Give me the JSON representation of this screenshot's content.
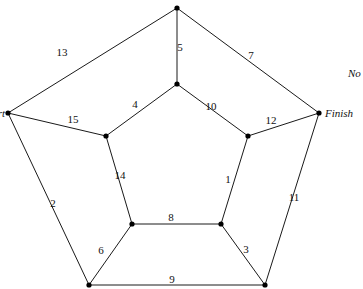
{
  "graph": {
    "nodes": [
      {
        "id": "outer_top",
        "x": 177,
        "y": 8
      },
      {
        "id": "inner_top",
        "x": 177,
        "y": 84
      },
      {
        "id": "start",
        "x": 8,
        "y": 113,
        "label": "Start"
      },
      {
        "id": "finish",
        "x": 319,
        "y": 113,
        "label": "Finish"
      },
      {
        "id": "inner_left",
        "x": 106,
        "y": 136
      },
      {
        "id": "inner_right",
        "x": 248,
        "y": 136
      },
      {
        "id": "inner_bottom_left",
        "x": 132,
        "y": 224
      },
      {
        "id": "inner_bottom_right",
        "x": 221,
        "y": 224
      },
      {
        "id": "outer_bottom_left",
        "x": 89,
        "y": 285
      },
      {
        "id": "outer_bottom_right",
        "x": 265,
        "y": 285
      }
    ],
    "edges": [
      {
        "from": "start",
        "to": "outer_top",
        "weight": "13",
        "lx": 62,
        "ly": 56
      },
      {
        "from": "outer_top",
        "to": "finish",
        "weight": "7",
        "lx": 251,
        "ly": 59
      },
      {
        "from": "outer_top",
        "to": "inner_top",
        "weight": "5",
        "lx": 180,
        "ly": 51
      },
      {
        "from": "start",
        "to": "inner_left",
        "weight": "15",
        "lx": 73,
        "ly": 123
      },
      {
        "from": "inner_top",
        "to": "inner_left",
        "weight": "4",
        "lx": 135,
        "ly": 108
      },
      {
        "from": "inner_top",
        "to": "inner_right",
        "weight": "10",
        "lx": 211,
        "ly": 110
      },
      {
        "from": "inner_right",
        "to": "finish",
        "weight": "12",
        "lx": 271,
        "ly": 124
      },
      {
        "from": "inner_left",
        "to": "inner_bottom_left",
        "weight": "14",
        "lx": 120,
        "ly": 179
      },
      {
        "from": "inner_right",
        "to": "inner_bottom_right",
        "weight": "1",
        "lx": 228,
        "ly": 183
      },
      {
        "from": "start",
        "to": "outer_bottom_left",
        "weight": "2",
        "lx": 53,
        "ly": 207
      },
      {
        "from": "finish",
        "to": "outer_bottom_right",
        "weight": "11",
        "lx": 294,
        "ly": 201
      },
      {
        "from": "inner_bottom_left",
        "to": "inner_bottom_right",
        "weight": "8",
        "lx": 171,
        "ly": 221
      },
      {
        "from": "inner_bottom_left",
        "to": "outer_bottom_left",
        "weight": "6",
        "lx": 101,
        "ly": 254
      },
      {
        "from": "inner_bottom_right",
        "to": "outer_bottom_right",
        "weight": "3",
        "lx": 246,
        "ly": 253
      },
      {
        "from": "outer_bottom_left",
        "to": "outer_bottom_right",
        "weight": "9",
        "lx": 172,
        "ly": 283
      }
    ]
  },
  "labels": {
    "start": "Start",
    "finish": "Finish",
    "clipped_note": "No"
  }
}
